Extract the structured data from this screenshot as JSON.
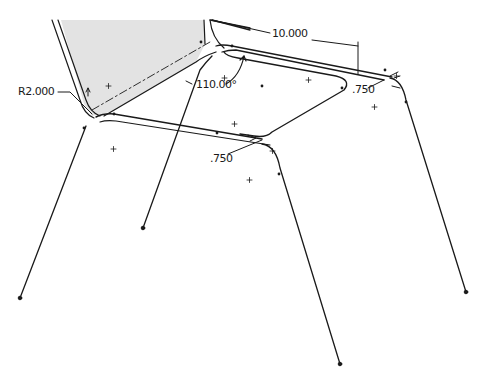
{
  "drawing": {
    "type": "cad-sketch",
    "subject": "chair frame",
    "colors": {
      "line": "#1a1a1a",
      "back_panel_fill": "#e3e3e3",
      "background": "#ffffff"
    },
    "dimensions": {
      "radius": "R2.000",
      "angle": "110.00°",
      "length": "10.000",
      "offset_right": ".750",
      "offset_front": ".750"
    }
  }
}
